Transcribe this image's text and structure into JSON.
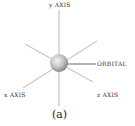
{
  "diagram": {
    "labels": {
      "y_axis": "y AXIS",
      "x_axis": "x AXIS",
      "z_axis": "z AXIS",
      "orbital": "ORBITAL"
    },
    "caption": "(a)",
    "colors": {
      "axis_line": "#c8c8c8",
      "leader_line": "#555555",
      "sphere_light": "#f2f2f2",
      "sphere_dark": "#8a8a8a",
      "text": "#333333"
    }
  }
}
